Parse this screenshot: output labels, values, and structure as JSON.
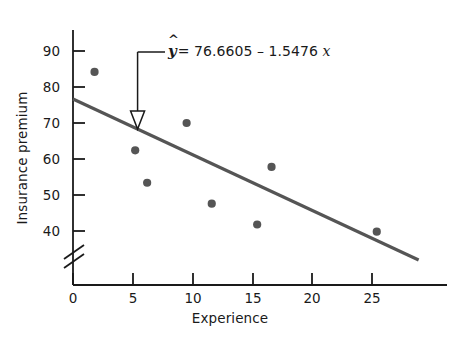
{
  "chart_data": {
    "type": "scatter",
    "title": "",
    "xlabel": "Experience",
    "ylabel": "Insurance premium",
    "xlim": [
      0,
      31
    ],
    "ylim": [
      35,
      95
    ],
    "grid": false,
    "legend": "none",
    "xticks": [
      "0",
      "5",
      "10",
      "15",
      "20",
      "25"
    ],
    "xtick_values": [
      0,
      5,
      10,
      15,
      20,
      25
    ],
    "yticks": [
      "40",
      "50",
      "60",
      "70",
      "80",
      "90"
    ],
    "ytick_values": [
      40,
      50,
      60,
      70,
      80,
      90
    ],
    "y_axis_break": true,
    "points": [
      {
        "x": 1.8,
        "y": 84.2
      },
      {
        "x": 5.2,
        "y": 62.4
      },
      {
        "x": 6.2,
        "y": 53.4
      },
      {
        "x": 9.5,
        "y": 70.0
      },
      {
        "x": 11.6,
        "y": 47.6
      },
      {
        "x": 15.4,
        "y": 41.8
      },
      {
        "x": 16.6,
        "y": 57.8
      },
      {
        "x": 25.4,
        "y": 39.8
      }
    ],
    "fit_line": {
      "intercept": 76.6605,
      "slope": -1.5476,
      "x_start": 0,
      "x_end": 28.9
    },
    "annotation": {
      "label_yhat": "y",
      "label_hat": "^",
      "label_equals": "=",
      "label_intercept": "76.6605",
      "label_minus": "–",
      "label_slope": "1.5476",
      "label_xvar": "x",
      "full_text": "ŷ = 76.6605 – 1.5476 x",
      "points_to_x": 5.4,
      "arrow_type": "hollow-down-arrow"
    },
    "colors": {
      "point": "#555555",
      "line": "#555555",
      "axis": "#1a1a1a",
      "text": "#1a1a1a",
      "background": "#ffffff"
    }
  }
}
